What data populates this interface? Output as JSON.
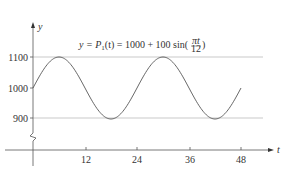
{
  "chart_data": {
    "type": "line",
    "title_parts": {
      "lhs": "y = P",
      "sub": "1",
      "mid": "(t) = 1000 + 100 sin(",
      "frac_num": "πt",
      "frac_den": "12",
      "end": ")"
    },
    "xlabel": "t",
    "ylabel": "y",
    "x_ticks": [
      12,
      24,
      36,
      48
    ],
    "x_tick_labels": [
      "12",
      "24",
      "36",
      "48"
    ],
    "y_ticks": [
      900,
      1000,
      1100
    ],
    "y_tick_labels": [
      "900",
      "1000",
      "1100"
    ],
    "xlim": [
      0,
      52
    ],
    "ylim": [
      850,
      1150
    ],
    "axis_break": true,
    "reference_lines": [
      1100,
      900
    ],
    "grid": false,
    "series": [
      {
        "name": "P1(t) = 1000 + 100 sin(pi t / 12)",
        "function": "1000 + 100*sin(pi*t/12)",
        "x": [
          0,
          3,
          6,
          9,
          12,
          15,
          18,
          21,
          24,
          27,
          30,
          33,
          36,
          39,
          42,
          45,
          48
        ],
        "values": [
          1000,
          1070.7,
          1100,
          1070.7,
          1000,
          929.3,
          900,
          929.3,
          1000,
          1070.7,
          1100,
          1070.7,
          1000,
          929.3,
          900,
          929.3,
          1000
        ]
      }
    ]
  }
}
